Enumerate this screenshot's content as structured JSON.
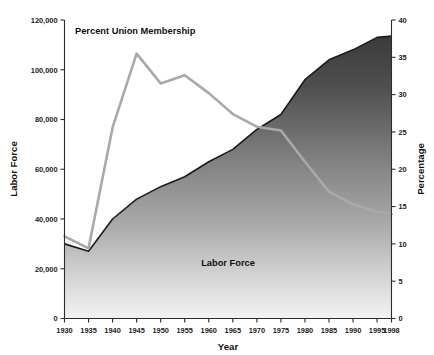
{
  "chart_data": {
    "type": "area",
    "title": "",
    "xlabel": "Year",
    "ylabel": "Labor Force",
    "y2label": "Percentage",
    "grid": false,
    "legend_position": "inline-annotation",
    "x": [
      1930,
      1935,
      1940,
      1945,
      1950,
      1955,
      1960,
      1965,
      1970,
      1975,
      1980,
      1985,
      1990,
      1995,
      1998
    ],
    "xlim": [
      1930,
      1998
    ],
    "xticks": [
      "1930",
      "1935",
      "1940",
      "1945",
      "1950",
      "1955",
      "1960",
      "1965",
      "1970",
      "1975",
      "1980",
      "1985",
      "1990",
      "1995",
      "1998"
    ],
    "ylim": [
      0,
      120000
    ],
    "yticks": [
      "0",
      "20,000",
      "40,000",
      "60,000",
      "80,000",
      "100,000",
      "120,000"
    ],
    "y2lim": [
      0,
      40
    ],
    "y2ticks": [
      "0",
      "5",
      "10",
      "15",
      "20",
      "25",
      "30",
      "35",
      "40"
    ],
    "series": [
      {
        "name": "Labor Force",
        "axis": "left",
        "render": "area",
        "unit": "thousands of workers",
        "color_top": "#3f3f3f",
        "color_bottom": "#efefef",
        "edge_color": "#1c1c1c",
        "annotation": "Labor Force",
        "values": [
          30000,
          27000,
          40000,
          48000,
          53000,
          57000,
          63000,
          68000,
          76000,
          82000,
          96000,
          104000,
          108000,
          113000,
          113500
        ]
      },
      {
        "name": "Percent Union Membership",
        "axis": "right",
        "render": "line",
        "unit": "percent",
        "color": "#a9a9a9",
        "annotation": "Percent Union Membership",
        "values": [
          11.0,
          9.4,
          25.6,
          35.5,
          31.5,
          32.6,
          30.2,
          27.4,
          25.7,
          25.2,
          21.0,
          17.0,
          15.3,
          14.3,
          14.0
        ]
      }
    ],
    "annotations": [
      {
        "text": "Percent Union Membership",
        "x": 1938.5,
        "y_axis": "right",
        "y": 38.5
      },
      {
        "text": "Labor Force",
        "x": 1955,
        "y_axis": "left",
        "y": 23000
      }
    ]
  }
}
